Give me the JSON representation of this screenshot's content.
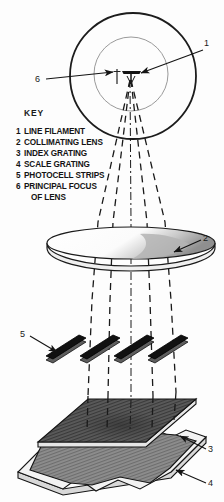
{
  "figure": {
    "key_heading": "KEY",
    "key_items": [
      {
        "num": "1",
        "label": "LINE FILAMENT"
      },
      {
        "num": "2",
        "label": "COLLIMATING LENS"
      },
      {
        "num": "3",
        "label": "INDEX GRATING"
      },
      {
        "num": "4",
        "label": "SCALE GRATING"
      },
      {
        "num": "5",
        "label": "PHOTOCELL STRIPS"
      },
      {
        "num": "6",
        "label": "PRINCIPAL FOCUS"
      },
      {
        "num": "",
        "label": "OF LENS"
      }
    ],
    "callouts": [
      {
        "id": "callout-1",
        "num": "1",
        "target": "line-filament"
      },
      {
        "id": "callout-2",
        "num": "2",
        "target": "collimating-lens"
      },
      {
        "id": "callout-3",
        "num": "3",
        "target": "index-grating"
      },
      {
        "id": "callout-4",
        "num": "4",
        "target": "scale-grating"
      },
      {
        "id": "callout-5",
        "num": "5",
        "target": "photocell-strips"
      },
      {
        "id": "callout-6",
        "num": "6",
        "target": "principal-focus"
      }
    ],
    "colors": {
      "background": "#fdfdfd",
      "ink": "#141414",
      "lens_shade": "#b9b9b9",
      "grating_fill": "#8d8d8d",
      "photocell_fill": "#111111"
    },
    "components": {
      "lamp_housing": "concentric circles",
      "light_rays": 5,
      "photocell_count": 4
    }
  }
}
